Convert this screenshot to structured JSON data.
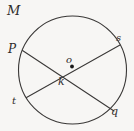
{
  "figure": {
    "type": "circle-with-intersecting-chords",
    "background_color": "#f7f6f4",
    "stroke_color": "#3a3837",
    "label_color": "#2e2c2b",
    "circle": {
      "center_x": 72.5,
      "center_y": 70,
      "radius": 54,
      "stroke_width": 1.1
    },
    "center_point": {
      "x": 72,
      "y": 66.5,
      "radius": 1.9,
      "fill": "#1a1a1a"
    },
    "intersection_point": {
      "x": 65,
      "y": 76
    },
    "chords": [
      {
        "name": "chord-p-q",
        "x1": 22.5,
        "y1": 50.5,
        "x2": 114,
        "y2": 111,
        "from_label": "P",
        "to_label": "q"
      },
      {
        "name": "chord-t-s",
        "x1": 26.5,
        "y1": 97.5,
        "x2": 120,
        "y2": 45,
        "from_label": "t",
        "to_label": "s"
      }
    ],
    "labels": {
      "circle_name": "M",
      "point_p": "P",
      "point_s": "s",
      "point_t": "t",
      "point_q": "q",
      "center": "o",
      "intersection": "k"
    }
  }
}
